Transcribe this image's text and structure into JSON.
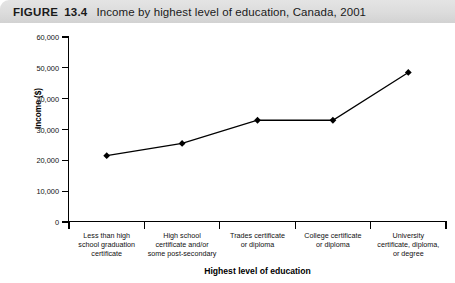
{
  "figure": {
    "label": "FIGURE",
    "number": "13.4",
    "caption": "Income by highest level of education, Canada, 2001"
  },
  "chart_data": {
    "type": "line",
    "title": "Income by highest level of education, Canada, 2001",
    "xlabel": "Highest level of education",
    "ylabel": "Income ($)",
    "categories": [
      "Less than high school graduation certificate",
      "High school certificate and/or some post-secondary",
      "Trades certificate or diploma",
      "College certificate or diploma",
      "University certificate, diploma, or degree"
    ],
    "category_lines": [
      [
        "Less than high",
        "school graduation",
        "certificate"
      ],
      [
        "High school",
        "certificate and/or",
        "some post-secondary"
      ],
      [
        "Trades certificate",
        "or diploma"
      ],
      [
        "College certificate",
        "or diploma"
      ],
      [
        "University",
        "certificate, diploma,",
        "or degree"
      ]
    ],
    "values": [
      21500,
      25500,
      33000,
      33000,
      48500
    ],
    "ylim": [
      0,
      60000
    ],
    "ytick_values": [
      0,
      10000,
      20000,
      30000,
      40000,
      50000,
      60000
    ],
    "ytick_labels": [
      "0",
      "10,000",
      "20,000",
      "30,000",
      "40,000",
      "50,000",
      "60,000"
    ],
    "grid": false,
    "legend": false,
    "marker": "diamond",
    "line_color": "#000000",
    "marker_color": "#000000"
  }
}
